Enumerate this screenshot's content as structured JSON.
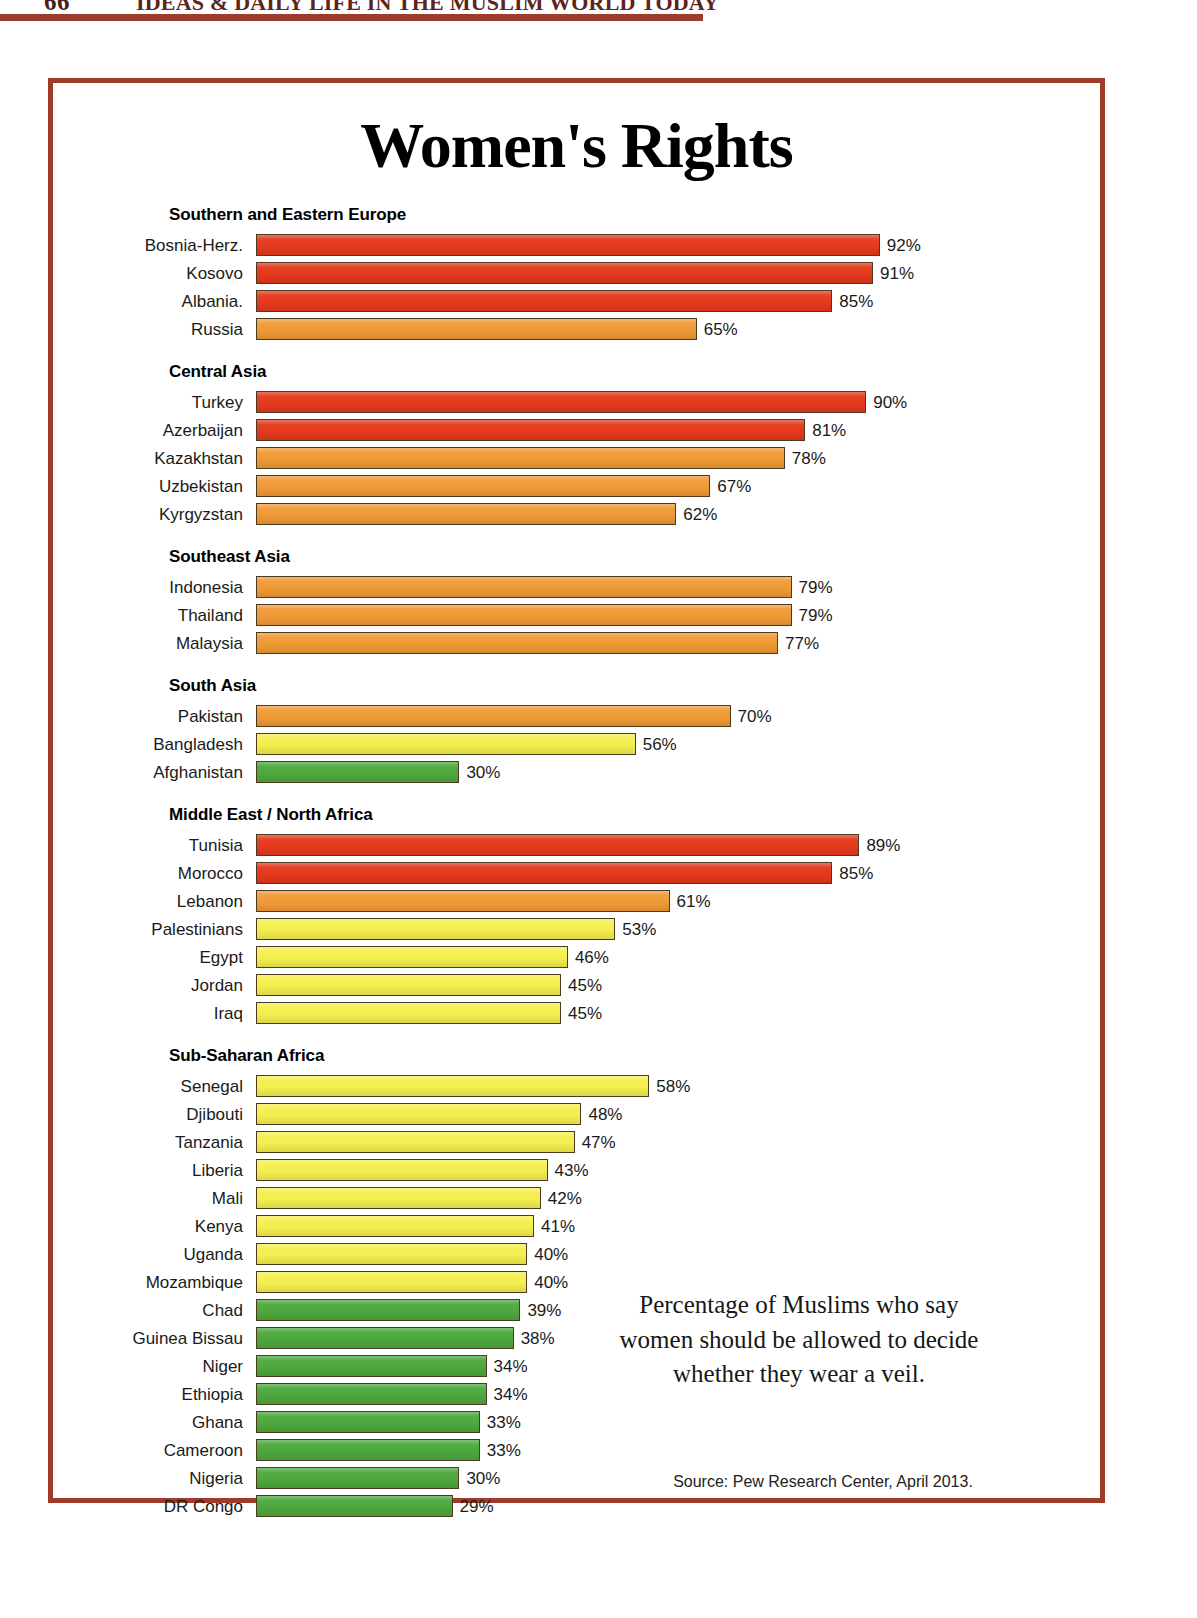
{
  "running_head": {
    "folio": "66",
    "title": "IDEAS & DAILY LIFE IN THE MUSLIM WORLD TODAY"
  },
  "poster": {
    "title": "Women's Rights",
    "caption": "Percentage of Muslims who say women should be allowed to decide whether they wear a veil.",
    "source": "Source: Pew Research Center, April 2013.",
    "frame_color": "#a03a29"
  },
  "palette": {
    "red": "#e5391c",
    "orange": "#f09a36",
    "yellow": "#f4ef4e",
    "green": "#4da83d",
    "bar_outline": "#4a3a20"
  },
  "chart_data": {
    "type": "bar",
    "orientation": "horizontal",
    "title": "Women's Rights",
    "subtitle": "Percentage of Muslims who say women should be allowed to decide whether they wear a veil.",
    "xlabel": "",
    "ylabel": "",
    "xlim": [
      0,
      100
    ],
    "unit": "%",
    "grid": false,
    "legend": null,
    "source": "Source: Pew Research Center, April 2013.",
    "groups": [
      {
        "name": "Southern and Eastern Europe",
        "categories": [
          "Bosnia-Herz.",
          "Kosovo",
          "Albania.",
          "Russia"
        ],
        "values": [
          92,
          91,
          85,
          65
        ],
        "labels": [
          "92%",
          "91%",
          "85%",
          "65%"
        ],
        "colors": [
          "red",
          "red",
          "red",
          "orange"
        ]
      },
      {
        "name": "Central Asia",
        "categories": [
          "Turkey",
          "Azerbaijan",
          "Kazakhstan",
          "Uzbekistan",
          "Kyrgyzstan"
        ],
        "values": [
          90,
          81,
          78,
          67,
          62
        ],
        "labels": [
          "90%",
          "81%",
          "78%",
          "67%",
          "62%"
        ],
        "colors": [
          "red",
          "red",
          "orange",
          "orange",
          "orange"
        ]
      },
      {
        "name": "Southeast Asia",
        "categories": [
          "Indonesia",
          "Thailand",
          "Malaysia"
        ],
        "values": [
          79,
          79,
          77
        ],
        "labels": [
          "79%",
          "79%",
          "77%"
        ],
        "colors": [
          "orange",
          "orange",
          "orange"
        ]
      },
      {
        "name": "South Asia",
        "categories": [
          "Pakistan",
          "Bangladesh",
          "Afghanistan"
        ],
        "values": [
          70,
          56,
          30
        ],
        "labels": [
          "70%",
          "56%",
          "30%"
        ],
        "colors": [
          "orange",
          "yellow",
          "green"
        ]
      },
      {
        "name": "Middle East / North Africa",
        "categories": [
          "Tunisia",
          "Morocco",
          "Lebanon",
          "Palestinians",
          "Egypt",
          "Jordan",
          "Iraq"
        ],
        "values": [
          89,
          85,
          61,
          53,
          46,
          45,
          45
        ],
        "labels": [
          "89%",
          "85%",
          "61%",
          "53%",
          "46%",
          "45%",
          "45%"
        ],
        "colors": [
          "red",
          "red",
          "orange",
          "yellow",
          "yellow",
          "yellow",
          "yellow"
        ]
      },
      {
        "name": "Sub-Saharan Africa",
        "categories": [
          "Senegal",
          "Djibouti",
          "Tanzania",
          "Liberia",
          "Mali",
          "Kenya",
          "Uganda",
          "Mozambique",
          "Chad",
          "Guinea Bissau",
          "Niger",
          "Ethiopia",
          "Ghana",
          "Cameroon",
          "Nigeria",
          "DR Congo"
        ],
        "values": [
          58,
          48,
          47,
          43,
          42,
          41,
          40,
          40,
          39,
          38,
          34,
          34,
          33,
          33,
          30,
          29
        ],
        "labels": [
          "58%",
          "48%",
          "47%",
          "43%",
          "42%",
          "41%",
          "40%",
          "40%",
          "39%",
          "38%",
          "34%",
          "34%",
          "33%",
          "33%",
          "30%",
          "29%"
        ],
        "colors": [
          "yellow",
          "yellow",
          "yellow",
          "yellow",
          "yellow",
          "yellow",
          "yellow",
          "yellow",
          "green",
          "green",
          "green",
          "green",
          "green",
          "green",
          "green",
          "green"
        ]
      }
    ]
  }
}
